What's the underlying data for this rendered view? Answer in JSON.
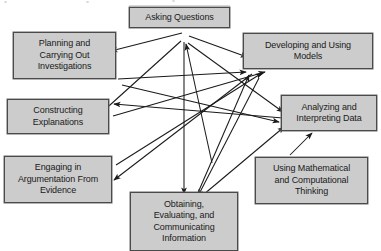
{
  "diagram": {
    "background_color": "#ffffff",
    "box_fill_color": "#cccccc",
    "box_border_color": "#4a4a4a",
    "arrow_color": "#1a1a1a",
    "canvas": {
      "width": 381,
      "height": 251
    },
    "nodes": [
      {
        "id": "asking-questions",
        "label": "Asking Questions",
        "x": 129,
        "y": 7,
        "w": 101,
        "h": 21
      },
      {
        "id": "planning-investigations",
        "label": "Planning and\nCarrying Out\nInvestigations",
        "x": 13,
        "y": 32,
        "w": 103,
        "h": 47
      },
      {
        "id": "developing-models",
        "label": "Developing and Using\nModels",
        "x": 243,
        "y": 33,
        "w": 130,
        "h": 36
      },
      {
        "id": "constructing-explanations",
        "label": "Constructing\nExplanations",
        "x": 7,
        "y": 99,
        "w": 102,
        "h": 35
      },
      {
        "id": "analyzing-data",
        "label": "Analyzing and\nInterpreting Data",
        "x": 281,
        "y": 95,
        "w": 96,
        "h": 36
      },
      {
        "id": "engaging-argumentation",
        "label": "Engaging in\nArgumentation From\nEvidence",
        "x": 4,
        "y": 156,
        "w": 108,
        "h": 47
      },
      {
        "id": "using-mathematics",
        "label": "Using Mathematical\nand Computational\nThinking",
        "x": 255,
        "y": 157,
        "w": 113,
        "h": 47
      },
      {
        "id": "obtaining-information",
        "label": "Obtaining,\nEvaluating, and\nCommunicating\nInformation",
        "x": 130,
        "y": 192,
        "w": 108,
        "h": 59
      }
    ],
    "connections": [
      {
        "from": "asking-questions",
        "to": "planning-investigations"
      },
      {
        "from": "asking-questions",
        "to": "developing-models"
      },
      {
        "from": "asking-questions",
        "to": "constructing-explanations"
      },
      {
        "from": "asking-questions",
        "to": "analyzing-data"
      },
      {
        "from": "asking-questions",
        "to": "obtaining-information"
      },
      {
        "from": "obtaining-information",
        "to": "asking-questions"
      },
      {
        "from": "planning-investigations",
        "to": "developing-models"
      },
      {
        "from": "planning-investigations",
        "to": "analyzing-data"
      },
      {
        "from": "constructing-explanations",
        "to": "developing-models"
      },
      {
        "from": "engaging-argumentation",
        "to": "developing-models"
      },
      {
        "from": "developing-models",
        "to": "engaging-argumentation"
      },
      {
        "from": "developing-models",
        "to": "obtaining-information"
      },
      {
        "from": "analyzing-data",
        "to": "constructing-explanations"
      },
      {
        "from": "using-mathematics",
        "to": "analyzing-data"
      },
      {
        "from": "obtaining-information",
        "to": "developing-models"
      },
      {
        "from": "obtaining-information",
        "to": "analyzing-data"
      }
    ]
  }
}
